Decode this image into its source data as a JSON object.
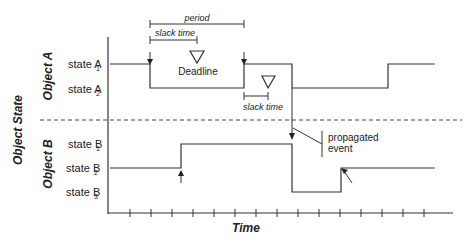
{
  "diagram": {
    "y_axis_title": "Object State",
    "x_axis_title": "Time",
    "object_a": {
      "title": "Object A",
      "states": [
        {
          "name": "state A",
          "sub": "1"
        },
        {
          "name": "state A",
          "sub": "2"
        }
      ]
    },
    "object_b": {
      "title": "Object B",
      "states": [
        {
          "name": "state B",
          "sub": "1"
        },
        {
          "name": "state B",
          "sub": "2"
        },
        {
          "name": "state B",
          "sub": "3"
        }
      ]
    },
    "annotations": {
      "period": "period",
      "slack_time_1": "slack time",
      "deadline": "Deadline",
      "slack_time_2": "slack time",
      "propagated_event_line1": "propagated",
      "propagated_event_line2": "event"
    },
    "time_tick_count": 15,
    "colors": {
      "line": "#333333",
      "text": "#222222",
      "background": "#ffffff"
    }
  }
}
